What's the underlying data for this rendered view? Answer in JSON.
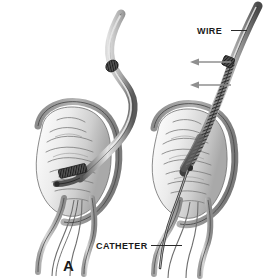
{
  "figure": {
    "domain_kind": "medical-illustration",
    "panel_letter": "A",
    "background_color": "#ffffff",
    "ink_color": "#1a1a1a",
    "arrow_color": "#8f8f8f",
    "tissue_light": "#efefef",
    "tissue_mid": "#b9b9b9",
    "tissue_dark": "#7d7d7d",
    "tube_light": "#d8d8d8",
    "tube_mid": "#9a9a9a",
    "tube_dark": "#4a4a4a",
    "marker_band": "#3b3b3b"
  },
  "labels": {
    "wire": "WIRE",
    "catheter": "CATHETER",
    "panel": "A"
  },
  "arrows": [
    {
      "name": "push-arrow-upper",
      "direction": "left",
      "x_start": 231,
      "x_end": 192,
      "y": 62
    },
    {
      "name": "push-arrow-lower",
      "direction": "left",
      "x_start": 231,
      "x_end": 192,
      "y": 85
    }
  ],
  "panels": [
    {
      "name": "left-panel",
      "description": "Catheter curved through organ cavity with radiopaque marker band",
      "instrument": "catheter"
    },
    {
      "name": "right-panel",
      "description": "Wire advanced through catheter into outlet tract",
      "instrument": "wire"
    }
  ]
}
